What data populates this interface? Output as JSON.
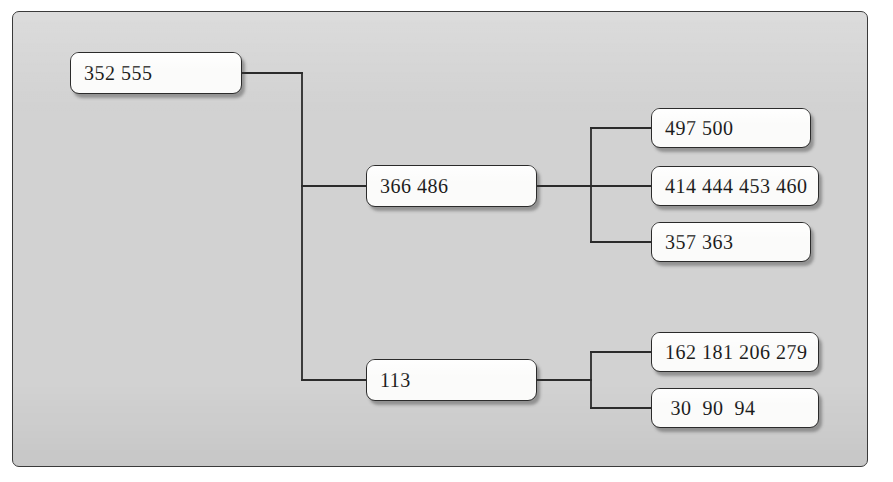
{
  "diagram": {
    "type": "tree",
    "orientation": "left-to-right",
    "panel_color": "#d2d2d2",
    "node_fill": "#fbfbfa",
    "line_color": "#2b2b2b",
    "nodes": [
      {
        "id": "root",
        "label": "352 555",
        "level": 0
      },
      {
        "id": "n1",
        "label": "366 486",
        "level": 1
      },
      {
        "id": "n2",
        "label": "113",
        "level": 1
      },
      {
        "id": "l1",
        "label": "497 500",
        "level": 2
      },
      {
        "id": "l2",
        "label": "414 444 453 460",
        "level": 2
      },
      {
        "id": "l3",
        "label": "357 363",
        "level": 2
      },
      {
        "id": "l4",
        "label": "162 181 206 279",
        "level": 2
      },
      {
        "id": "l5",
        "label": " 30  90  94",
        "level": 2
      }
    ],
    "edges": [
      {
        "from": "root",
        "to": "n1"
      },
      {
        "from": "root",
        "to": "n2"
      },
      {
        "from": "n1",
        "to": "l1"
      },
      {
        "from": "n1",
        "to": "l2"
      },
      {
        "from": "n1",
        "to": "l3"
      },
      {
        "from": "n2",
        "to": "l4"
      },
      {
        "from": "n2",
        "to": "l5"
      }
    ]
  }
}
